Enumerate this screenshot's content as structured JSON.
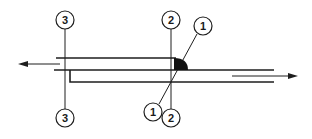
{
  "diagram": {
    "type": "lap-joint-weld-cross-section",
    "colors": {
      "line": "#1e1e1e",
      "weld": "#111111",
      "background": "#ffffff"
    },
    "callouts": [
      {
        "id": "callout-3-top",
        "label": "3",
        "cx": 65,
        "cy": 20
      },
      {
        "id": "callout-3-bottom",
        "label": "3",
        "cx": 65,
        "cy": 118
      },
      {
        "id": "callout-2-top",
        "label": "2",
        "cx": 171,
        "cy": 20
      },
      {
        "id": "callout-2-bottom",
        "label": "2",
        "cx": 171,
        "cy": 118
      },
      {
        "id": "callout-1-top",
        "label": "1",
        "cx": 203,
        "cy": 26
      },
      {
        "id": "callout-1-bottom",
        "label": "1",
        "cx": 153,
        "cy": 112
      }
    ],
    "arrows": [
      {
        "id": "force-arrow-left",
        "direction": "left"
      },
      {
        "id": "force-arrow-right",
        "direction": "right"
      }
    ]
  }
}
